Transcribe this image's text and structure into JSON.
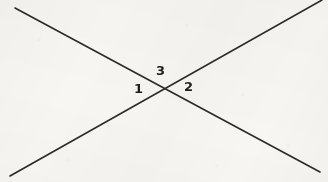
{
  "figure": {
    "name": "two-intersecting-lines-with-angle-labels",
    "canvas": {
      "width": 328,
      "height": 182
    },
    "background_color": "#f7f6f3",
    "ink_color": "#2a2a2a",
    "label_color": "#1f1f1f"
  },
  "lines": [
    {
      "id": "line-descending",
      "description": "straight line from upper-left to lower-right",
      "x1": 15,
      "y1": 8,
      "x2": 320,
      "y2": 172,
      "stroke_width": 1.6
    },
    {
      "id": "line-ascending",
      "description": "straight line from lower-left to upper-right",
      "x1": 10,
      "y1": 176,
      "x2": 322,
      "y2": 0,
      "stroke_width": 1.6
    }
  ],
  "intersection": {
    "x": 163,
    "y": 87
  },
  "labels": [
    {
      "id": "angle-label-1",
      "text": "1",
      "x": 134,
      "y": 82,
      "font_size": 13
    },
    {
      "id": "angle-label-3",
      "text": "3",
      "x": 156,
      "y": 64,
      "font_size": 13
    },
    {
      "id": "angle-label-2",
      "text": "2",
      "x": 184,
      "y": 80,
      "font_size": 13
    }
  ]
}
